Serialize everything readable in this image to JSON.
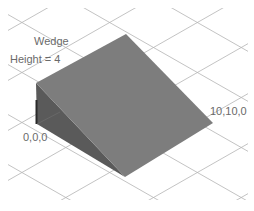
{
  "diagram": {
    "title": "Wedge",
    "parameter": "Height = 4",
    "origin_label": "0,0,0",
    "corner_label": "10,10,0",
    "colors": {
      "background": "#ffffff",
      "grid": "#b4b4b4",
      "slope_face": "#7d7d7d",
      "side_face": "#5a5a5a",
      "side_edge": "#2a2a2a",
      "label": "#6a6a6a"
    },
    "shape": {
      "type": "wedge",
      "vertices_2d": {
        "ridge_back_right": [
          126,
          34
        ],
        "ridge_front_left": [
          36,
          83
        ],
        "base_origin": [
          37,
          124
        ],
        "base_front": [
          125,
          177
        ],
        "base_right": [
          213,
          123
        ]
      }
    }
  }
}
